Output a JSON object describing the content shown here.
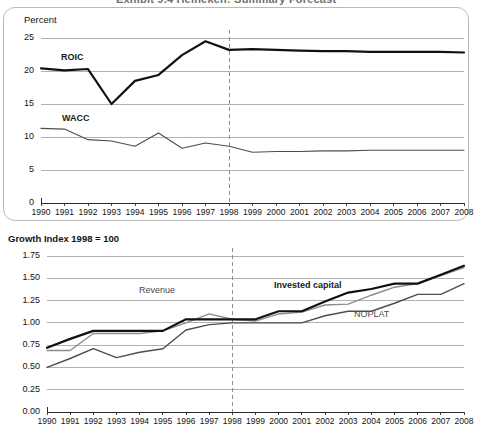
{
  "clipped_title": "Exhibit 9.4  Heineken: Summary Forecast",
  "charts": [
    {
      "id": "roic-wacc",
      "name": "roic-wacc-chart",
      "axis_title": "Percent",
      "x_categories": [
        "1990",
        "1991",
        "1992",
        "1993",
        "1994",
        "1995",
        "1996",
        "1997",
        "1998",
        "1999",
        "2000",
        "2001",
        "2002",
        "2003",
        "2004",
        "2005",
        "2006",
        "2007",
        "2008"
      ],
      "y_ticks": [
        "0",
        "5",
        "10",
        "15",
        "20",
        "25"
      ],
      "forecast_divider_year": "1998",
      "series": [
        {
          "name": "ROIC",
          "label": "ROIC",
          "label_style": "bold",
          "color": "#111111",
          "width": 2.2,
          "values": [
            20.4,
            20.1,
            20.3,
            15.0,
            18.5,
            19.4,
            22.4,
            24.5,
            23.2,
            23.3,
            23.2,
            23.1,
            23.0,
            23.0,
            22.9,
            22.9,
            22.9,
            22.9,
            22.8
          ]
        },
        {
          "name": "WACC",
          "label": "WACC",
          "label_style": "bold",
          "color": "#4d4d4d",
          "width": 1.1,
          "values": [
            11.3,
            11.2,
            9.6,
            9.4,
            8.6,
            10.6,
            8.3,
            9.1,
            8.6,
            7.7,
            7.8,
            7.8,
            7.9,
            7.9,
            8.0,
            8.0,
            8.0,
            8.0,
            8.0
          ]
        }
      ]
    },
    {
      "id": "growth-index",
      "name": "growth-index-chart",
      "axis_title": "Growth Index 1998 = 100",
      "x_categories": [
        "1990",
        "1991",
        "1992",
        "1993",
        "1994",
        "1995",
        "1996",
        "1997",
        "1998",
        "1999",
        "2000",
        "2001",
        "2002",
        "2003",
        "2004",
        "2005",
        "2006",
        "2007",
        "2008"
      ],
      "y_ticks": [
        "0.00",
        "0.25",
        "0.50",
        "0.75",
        "1.00",
        "1.25",
        "1.50",
        "1.75"
      ],
      "forecast_divider_year": "1998",
      "series": [
        {
          "name": "Invested capital",
          "label": "Invested capital",
          "label_style": "bold",
          "color": "#111111",
          "width": 2.2,
          "values": [
            0.72,
            0.82,
            0.91,
            0.91,
            0.91,
            0.91,
            1.04,
            1.04,
            1.04,
            1.04,
            1.13,
            1.13,
            1.24,
            1.34,
            1.38,
            1.44,
            1.44,
            1.54,
            1.64
          ]
        },
        {
          "name": "Revenue",
          "label": "Revenue",
          "label_style": "grey",
          "color": "#8c8c8c",
          "width": 1.4,
          "values": [
            0.69,
            0.69,
            0.88,
            0.88,
            0.88,
            0.91,
            1.0,
            1.1,
            1.04,
            1.02,
            1.1,
            1.12,
            1.2,
            1.21,
            1.31,
            1.4,
            1.44,
            1.53,
            1.62
          ]
        },
        {
          "name": "NOPLAT",
          "label": "NOPLAT",
          "label_style": "grey",
          "color": "#4d4d4d",
          "width": 1.4,
          "values": [
            0.5,
            0.6,
            0.71,
            0.61,
            0.67,
            0.71,
            0.92,
            0.98,
            1.0,
            1.0,
            1.0,
            1.0,
            1.08,
            1.13,
            1.13,
            1.22,
            1.32,
            1.32,
            1.44
          ]
        }
      ]
    }
  ]
}
